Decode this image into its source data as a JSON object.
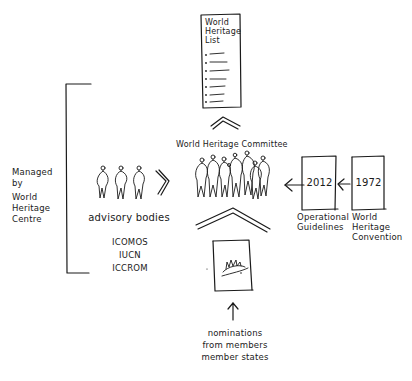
{
  "diagram": {
    "list_card": {
      "title_lines": [
        "World",
        "Heritage",
        "List"
      ],
      "bullet_count": 7
    },
    "managed_by": {
      "lines": [
        "Managed",
        "by",
        "World",
        "Heritage",
        "Centre"
      ]
    },
    "advisory": {
      "label": "advisory bodies",
      "members": [
        "ICOMOS",
        "IUCN",
        "ICCROM"
      ],
      "figure_count": 3
    },
    "committee": {
      "label": "World Heritage Committee",
      "figure_count": 8
    },
    "operational_guidelines": {
      "year": "2012",
      "lines": [
        "Operational",
        "Guidelines"
      ]
    },
    "convention": {
      "year": "1972",
      "lines": [
        "World",
        "Heritage",
        "Convention"
      ]
    },
    "nominations": {
      "lines": [
        "nominations",
        "from members",
        "member states"
      ]
    },
    "colors": {
      "ink": "#1a1a1a",
      "paper": "#ffffff"
    }
  }
}
